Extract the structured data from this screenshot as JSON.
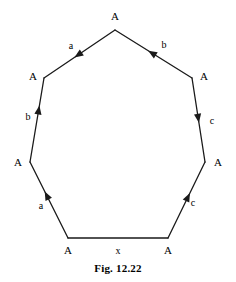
{
  "figure": {
    "caption": "Fig. 12.22",
    "shape": "heptagon",
    "stroke_color": "#1a1a1a",
    "background_color": "#ffffff",
    "vertices": [
      {
        "id": "v-top",
        "label": "A",
        "x": 115,
        "y": 30,
        "label_x": 115,
        "label_y": 16
      },
      {
        "id": "v-upper-left",
        "label": "A",
        "x": 44,
        "y": 78,
        "label_x": 33,
        "label_y": 76
      },
      {
        "id": "v-upper-right",
        "label": "A",
        "x": 192,
        "y": 78,
        "label_x": 204,
        "label_y": 76
      },
      {
        "id": "v-mid-left",
        "label": "A",
        "x": 30,
        "y": 162,
        "label_x": 18,
        "label_y": 162
      },
      {
        "id": "v-mid-right",
        "label": "A",
        "x": 205,
        "y": 162,
        "label_x": 218,
        "label_y": 162
      },
      {
        "id": "v-bottom-left",
        "label": "A",
        "x": 68,
        "y": 238,
        "label_x": 68,
        "label_y": 250
      },
      {
        "id": "v-bottom-right",
        "label": "A",
        "x": 168,
        "y": 238,
        "label_x": 168,
        "label_y": 250
      }
    ],
    "edges": [
      {
        "id": "edge-a-top-left",
        "label": "a",
        "from": "v-top",
        "to": "v-upper-left",
        "arrow": true,
        "arrow_t": 0.52,
        "arrow_dir": "to",
        "label_x": 71,
        "label_y": 45
      },
      {
        "id": "edge-b-top-right",
        "label": "b",
        "from": "v-upper-right",
        "to": "v-top",
        "arrow": true,
        "arrow_t": 0.52,
        "arrow_dir": "to",
        "label_x": 164,
        "label_y": 44
      },
      {
        "id": "edge-b-left-upper",
        "label": "b",
        "from": "v-mid-left",
        "to": "v-upper-left",
        "arrow": true,
        "arrow_t": 0.62,
        "arrow_dir": "to",
        "label_x": 28,
        "label_y": 116
      },
      {
        "id": "edge-c-right-upper",
        "label": "c",
        "from": "v-upper-right",
        "to": "v-mid-right",
        "arrow": true,
        "arrow_t": 0.48,
        "arrow_dir": "to",
        "label_x": 212,
        "label_y": 120
      },
      {
        "id": "edge-a-left-lower",
        "label": "a",
        "from": "v-bottom-left",
        "to": "v-mid-left",
        "arrow": true,
        "arrow_t": 0.56,
        "arrow_dir": "to",
        "label_x": 41,
        "label_y": 205
      },
      {
        "id": "edge-c-right-lower",
        "label": "c",
        "from": "v-bottom-right",
        "to": "v-mid-right",
        "arrow": true,
        "arrow_t": 0.54,
        "arrow_dir": "to",
        "label_x": 193,
        "label_y": 202
      },
      {
        "id": "edge-x-bottom",
        "label": "x",
        "from": "v-bottom-left",
        "to": "v-bottom-right",
        "arrow": false,
        "arrow_t": 0.5,
        "arrow_dir": "to",
        "label_x": 118,
        "label_y": 250
      }
    ]
  }
}
